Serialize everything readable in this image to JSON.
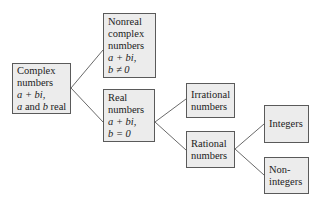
{
  "diagram": {
    "colors": {
      "box_fill": "#ececec",
      "box_border": "#5a5a5a",
      "line": "#6a6a6a",
      "text": "#222222"
    },
    "nodes": {
      "complex": {
        "lines": [
          "Complex",
          "numbers"
        ],
        "math": [
          "a + bi,"
        ],
        "last": {
          "a": "a",
          "mid": " and ",
          "b": "b",
          "end": " real"
        }
      },
      "nonreal": {
        "lines": [
          "Nonreal",
          "complex",
          "numbers"
        ],
        "math": [
          "a + bi,",
          "b ≠ 0"
        ]
      },
      "real": {
        "lines": [
          "Real",
          "numbers"
        ],
        "math": [
          "a + bi,",
          "b = 0"
        ]
      },
      "irrational": {
        "lines": [
          "Irrational",
          "numbers"
        ]
      },
      "rational": {
        "lines": [
          "Rational",
          "numbers"
        ]
      },
      "integers": {
        "lines": [
          "Integers"
        ]
      },
      "nonintegers": {
        "lines": [
          "Non-",
          "integers"
        ]
      }
    },
    "edges": [
      [
        "complex",
        "nonreal"
      ],
      [
        "complex",
        "real"
      ],
      [
        "real",
        "irrational"
      ],
      [
        "real",
        "rational"
      ],
      [
        "rational",
        "integers"
      ],
      [
        "rational",
        "nonintegers"
      ]
    ]
  }
}
